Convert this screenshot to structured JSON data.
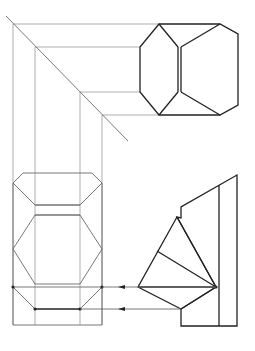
{
  "diagram": {
    "type": "orthographic-projection",
    "colors": {
      "construction": "#9a9a9a",
      "view_outline": "#6a6a6a",
      "edge": "#222222",
      "background": "#ffffff"
    },
    "miter_line": {
      "from": [
        6,
        16
      ],
      "to": [
        128,
        141
      ]
    },
    "projection_verticals_x": [
      13,
      35,
      80,
      102
    ],
    "projection_horizontals_y": [
      24,
      47,
      92,
      115
    ],
    "top_view": {
      "outline": [
        [
          159,
          24
        ],
        [
          220,
          24
        ],
        [
          238,
          34
        ],
        [
          238,
          105
        ],
        [
          220,
          115
        ],
        [
          159,
          115
        ],
        [
          140,
          92
        ],
        [
          140,
          47
        ]
      ],
      "inner_edges": [
        [
          [
            159,
            24
          ],
          [
            178,
            47
          ]
        ],
        [
          [
            159,
            115
          ],
          [
            178,
            92
          ]
        ],
        [
          [
            220,
            24
          ],
          [
            181,
            47
          ]
        ],
        [
          [
            220,
            115
          ],
          [
            181,
            92
          ]
        ]
      ],
      "double_line_x": [
        178,
        181
      ],
      "double_line_y": [
        47,
        92
      ]
    },
    "front_view": {
      "frame": {
        "x1": 13,
        "x2": 102,
        "y_top": 183,
        "y_bottom": 325
      },
      "top_cap": [
        [
          13,
          183
        ],
        [
          23,
          173
        ],
        [
          92,
          173
        ],
        [
          102,
          183
        ],
        [
          80,
          205
        ],
        [
          35,
          205
        ]
      ],
      "mid_band_y": [
        205,
        215
      ],
      "hexagon": [
        [
          35,
          215
        ],
        [
          80,
          215
        ],
        [
          102,
          249
        ],
        [
          80,
          284
        ],
        [
          35,
          284
        ],
        [
          13,
          249
        ]
      ],
      "lower_line_y": 287,
      "bottom_points": [
        [
          35,
          309
        ],
        [
          80,
          309
        ]
      ],
      "dots": [
        [
          13,
          287
        ],
        [
          35,
          309
        ],
        [
          80,
          309
        ],
        [
          102,
          287
        ]
      ]
    },
    "side_view": {
      "outline": [
        [
          237,
          175
        ],
        [
          237,
          326
        ],
        [
          181,
          326
        ],
        [
          181,
          309
        ],
        [
          216,
          287
        ],
        [
          177,
          217
        ],
        [
          181,
          218
        ],
        [
          181,
          207
        ]
      ],
      "inner_vertical": {
        "x": 219,
        "y1": 185,
        "y2": 326
      },
      "fan_vertex": [
        216,
        287
      ],
      "fan_points": [
        [
          177,
          217
        ],
        [
          157,
          251
        ],
        [
          138,
          287
        ],
        [
          181,
          309
        ]
      ],
      "dot": [
        216,
        287
      ]
    },
    "arrows": [
      {
        "from": [
          216,
          287
        ],
        "to": [
          102,
          287
        ],
        "head_x": 123
      },
      {
        "from": [
          181,
          309
        ],
        "to": [
          80,
          309
        ],
        "head_x": 123
      }
    ]
  }
}
